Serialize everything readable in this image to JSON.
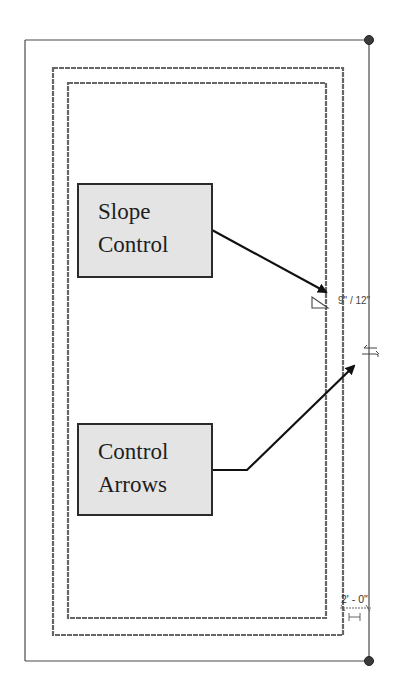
{
  "diagram": {
    "callouts": [
      {
        "id": "slope-control",
        "lines": [
          "Slope",
          "Control"
        ]
      },
      {
        "id": "control-arrows",
        "lines": [
          "Control",
          "Arrows"
        ]
      }
    ],
    "annotations": {
      "slope_value": "9\" / 12\"",
      "offset_dimension": "2' - 0\""
    },
    "icons": {
      "slope_icon": "slope-triangle-icon",
      "control_arrows_icon": "flip-arrows-icon",
      "corner_grips": [
        "grip-dot-icon",
        "grip-dot-icon"
      ]
    },
    "colors": {
      "outline": "#555555",
      "callout_fill": "#e4e4e4",
      "callout_border": "#2b2b2b",
      "arrow": "#111111",
      "grip": "#3a3a3a"
    }
  }
}
